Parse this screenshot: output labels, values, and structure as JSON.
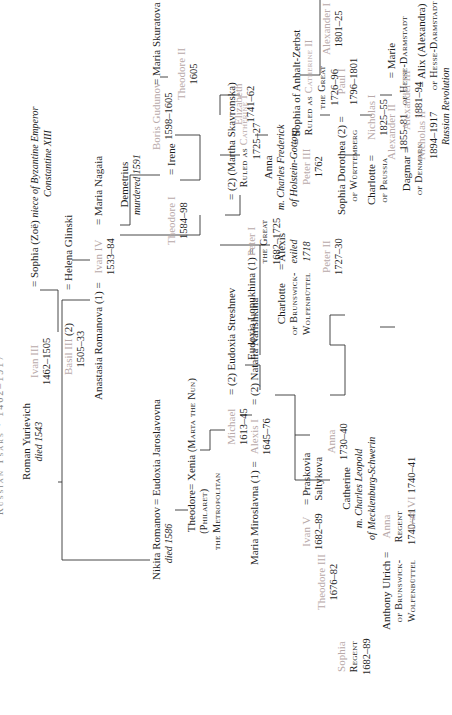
{
  "title": "Russian Tsars · 1462–1917",
  "colors": {
    "tsar": "#b8a9a9",
    "text": "#1e1e1e",
    "line": "#333333"
  },
  "nodes": {
    "ivan3": {
      "name": "Ivan III",
      "years": "1462–1505"
    },
    "sophia_zoe": {
      "name": "Sophia (Zoë)",
      "note": "niece of Byzantine Emperor",
      "note2": "Constantine XIII"
    },
    "basil3": {
      "name": "Basil III",
      "years": "1505–33",
      "marriage": "(2)"
    },
    "helena": {
      "name": "Helena Glinski"
    },
    "anastasia": {
      "name": "Anastasia Romanova",
      "marriage": "(1)"
    },
    "ivan4": {
      "name": "Ivan IV",
      "years": "1533–84",
      "marriage": "(7)"
    },
    "maria_nagaia": {
      "name": "Maria Nagaia"
    },
    "demetrius": {
      "name": "Demetrius",
      "note": "murdered 1591"
    },
    "theodore1": {
      "name": "Theodore I",
      "years": "1584–98"
    },
    "irene": {
      "name": "Irene"
    },
    "boris": {
      "name": "Boris Gudunov",
      "years": "1598–1605"
    },
    "maria_skuratova": {
      "name": "Maria Skuratova"
    },
    "theodore2": {
      "name": "Theodore II",
      "years": "1605"
    },
    "roman": {
      "name": "Roman Yurievich",
      "note": "died 1543"
    },
    "nikita": {
      "name": "Nikita Romanov",
      "note": "died 1586"
    },
    "eudoxia_j": {
      "name": "Eudoxia Jaroslavovna"
    },
    "theodore_philaret": {
      "name": "Theodore",
      "sub": "(Philaret)",
      "sub2": "the Metropolitan"
    },
    "xenia": {
      "name": "Xenia",
      "sub": "(Marta the Nun)"
    },
    "michael": {
      "name": "Michael",
      "years": "1613–45",
      "marriage": "(2)"
    },
    "eudoxia_s": {
      "name": "Eudoxia Streshnev"
    },
    "maria_miroslavna": {
      "name": "Maria Miroslavna",
      "marriage": "(1)"
    },
    "alexis": {
      "name": "Alexis I",
      "years": "1645–76",
      "marriage": "(2)"
    },
    "natalia": {
      "name": "Natalia Narishkina"
    },
    "sophia_regent": {
      "name": "Sophia",
      "sub": "Regent",
      "years": "1682–89"
    },
    "theodore3": {
      "name": "Theodore III",
      "years": "1676–82"
    },
    "ivan5": {
      "name": "Ivan V",
      "years": "1682–89"
    },
    "praskovia": {
      "name": "Praskovia",
      "sub": "Saltykova"
    },
    "anna_1730": {
      "name": "Anna",
      "years": "1730–40"
    },
    "catherine_m": {
      "name": "Catherine",
      "note": "m. Charles Leopold",
      "note2": "of Mecklenburg-Schwerin"
    },
    "anthony": {
      "name": "Anthony Ulrich",
      "sub": "of Brunswick-",
      "sub2": "Wolfenbüttel"
    },
    "anna_regent": {
      "name": "Anna",
      "sub": "Regent",
      "years": "1740–41"
    },
    "ivan6": {
      "name": "Ivan VI",
      "years": "1740–41"
    },
    "eudoxia_l": {
      "name": "Eudoxia Lopukhina",
      "marriage": "(1)"
    },
    "peter1": {
      "name": "Peter I",
      "sub": "the Great",
      "years": "1682–1725",
      "marriage": "(2)"
    },
    "martha": {
      "name": "(Martha Skavronska)",
      "sub": "Ruled as",
      "sub_tsar": "Catherine I",
      "years": "1725–27"
    },
    "charlotte_b": {
      "name": "Charlotte",
      "sub": "of Brunswick-",
      "sub2": "Wolfenbüttel"
    },
    "alexis_exiled": {
      "name": "Alexis",
      "note": "exiled",
      "note2": "1718"
    },
    "peter2": {
      "name": "Peter II",
      "years": "1727–30"
    },
    "anna_holstein": {
      "name": "Anna",
      "note": "m. Charles Frederick",
      "note2": "of Holstein-Gottorp"
    },
    "elizabeth": {
      "name": "Elizabeth",
      "years": "1741–62"
    },
    "peter3": {
      "name": "Peter III",
      "years": "1762"
    },
    "sophia_anhalt": {
      "name": "Sophia of Anhalt-Zerbst",
      "sub": "Ruled as",
      "sub_tsar": "Catherine II",
      "sub2": "the Great",
      "years": "1726–96"
    },
    "sophia_dorothea": {
      "name": "Sophia Dorothea",
      "sub": "of Württemberg",
      "marriage": "(2)"
    },
    "paul1": {
      "name": "Paul I",
      "years": "1796–1801"
    },
    "alexander1": {
      "name": "Alexander I",
      "years": "1801–25"
    },
    "charlotte_p": {
      "name": "Charlotte",
      "sub": "of Prussia"
    },
    "nicholas1": {
      "name": "Nicholas I",
      "years": "1825–55"
    },
    "alexander2": {
      "name": "Alexander II",
      "years": "1855–81"
    },
    "marie": {
      "name": "Marie",
      "sub": "of Hesse-Darmstadt"
    },
    "dagmar": {
      "name": "Dagmar",
      "sub": "of Denmark"
    },
    "alexander3": {
      "name": "Alexander III",
      "years": "1881–94"
    },
    "nicholas2": {
      "name": "Nicholas II",
      "years": "1894–1917"
    },
    "alix": {
      "name": "Alix (Alexandra)",
      "sub": "of Hesse-Darmstadt"
    },
    "revolution": {
      "note": "Russian Revolution"
    }
  }
}
